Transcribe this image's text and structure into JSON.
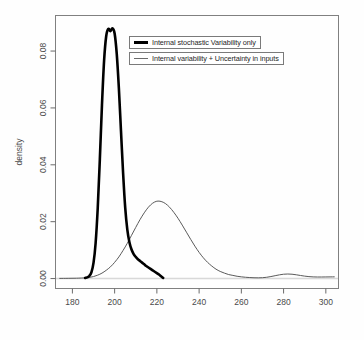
{
  "figure": {
    "background_color": "#fefefe",
    "frame_color": "#808080"
  },
  "axes": {
    "y_axis_title": "density",
    "x_axis_title": "",
    "x_ticks": [
      "180",
      "200",
      "220",
      "240",
      "260",
      "280",
      "300"
    ],
    "y_ticks": [
      "0.00",
      "0.02",
      "0.04",
      "0.06",
      "0.08"
    ]
  },
  "legend": {
    "entries": [
      {
        "label": "Internal stochastic Variability only",
        "style": "thick",
        "color": "#000000"
      },
      {
        "label": "Internal variability + Uncertainty in inputs",
        "style": "thin",
        "color": "#6b6b6b"
      }
    ]
  },
  "chart_data": {
    "type": "line",
    "title": "",
    "xlabel": "",
    "ylabel": "density",
    "xlim": [
      172,
      306
    ],
    "ylim": [
      -0.0035,
      0.0925
    ],
    "xticks": [
      180,
      200,
      220,
      240,
      260,
      280,
      300
    ],
    "yticks": [
      0.0,
      0.02,
      0.04,
      0.06,
      0.08
    ],
    "grid": false,
    "legend_position": "top-center",
    "series": [
      {
        "name": "Internal stochastic Variability only",
        "color": "#000000",
        "linewidth": 2.6,
        "x": [
          186,
          187,
          188,
          189,
          190,
          191,
          192,
          193,
          194,
          195,
          196,
          197,
          198,
          199,
          200,
          201,
          202,
          203,
          204,
          205,
          206,
          207,
          208,
          209,
          210,
          211,
          212,
          213,
          214,
          215,
          216,
          217,
          218,
          219,
          220,
          221,
          222,
          223
        ],
        "y": [
          0.0002,
          0.0004,
          0.0009,
          0.0022,
          0.0055,
          0.0125,
          0.0248,
          0.042,
          0.061,
          0.0765,
          0.0852,
          0.0878,
          0.087,
          0.088,
          0.0862,
          0.079,
          0.067,
          0.052,
          0.0372,
          0.025,
          0.0172,
          0.0128,
          0.0102,
          0.0086,
          0.0076,
          0.0068,
          0.0062,
          0.0056,
          0.005,
          0.0044,
          0.0039,
          0.0034,
          0.0029,
          0.0024,
          0.0019,
          0.0014,
          0.0008,
          0.0002
        ]
      },
      {
        "name": "Internal variability + Uncertainty in inputs",
        "color": "#5a5a5a",
        "linewidth": 1.0,
        "x": [
          174,
          178,
          182,
          186,
          188,
          190,
          192,
          194,
          196,
          198,
          200,
          202,
          204,
          206,
          208,
          210,
          212,
          214,
          216,
          218,
          220,
          222,
          224,
          226,
          228,
          230,
          232,
          234,
          236,
          238,
          240,
          242,
          244,
          246,
          248,
          250,
          252,
          254,
          256,
          258,
          260,
          262,
          264,
          266,
          268,
          270,
          272,
          274,
          276,
          278,
          280,
          282,
          284,
          286,
          288,
          290,
          292,
          294,
          296,
          298,
          300,
          302,
          304
        ],
        "y": [
          5e-05,
          8e-05,
          0.00012,
          0.00025,
          0.0004,
          0.0007,
          0.0012,
          0.0019,
          0.0029,
          0.0041,
          0.0057,
          0.0076,
          0.0099,
          0.0124,
          0.0152,
          0.018,
          0.0207,
          0.0231,
          0.0251,
          0.0265,
          0.0272,
          0.0271,
          0.0264,
          0.0251,
          0.0233,
          0.0212,
          0.0188,
          0.0163,
          0.0138,
          0.0114,
          0.0092,
          0.0073,
          0.0057,
          0.0044,
          0.0033,
          0.0025,
          0.0019,
          0.0014,
          0.0011,
          0.0008,
          0.0006,
          0.00045,
          0.00035,
          0.00028,
          0.00025,
          0.0003,
          0.00045,
          0.0007,
          0.001,
          0.0013,
          0.00152,
          0.0016,
          0.00152,
          0.00132,
          0.00108,
          0.00085,
          0.00068,
          0.00058,
          0.00054,
          0.00054,
          0.00056,
          0.00058,
          0.0006
        ]
      }
    ],
    "baseline": {
      "y": 0.0,
      "color": "#d8d8d8",
      "note": "light grey horizontal zero line across plot"
    }
  }
}
